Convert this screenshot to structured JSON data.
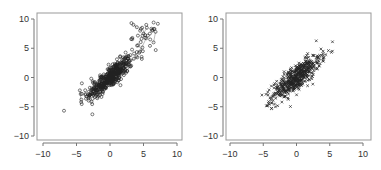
{
  "chart_data": [
    {
      "type": "scatter",
      "title": "",
      "xlabel": "",
      "ylabel": "",
      "xlim": [
        -11,
        11
      ],
      "ylim": [
        -11,
        11
      ],
      "xticks": [
        -10,
        -5,
        0,
        5,
        10
      ],
      "yticks": [
        -10,
        -5,
        0,
        5,
        10
      ],
      "xtick_labels": [
        "−10",
        "−5",
        "0",
        "5",
        "10"
      ],
      "ytick_labels": [
        "10",
        "5",
        "0",
        "−5",
        "−10"
      ],
      "grid": false,
      "marker": "circle",
      "connected_trace": true,
      "series": [
        {
          "name": "main-cloud",
          "center": [
            0,
            0
          ],
          "spread_x": 1.7,
          "corr": 0.85,
          "n": 420,
          "points_sample": [
            [
              -4.3,
              -4.2
            ],
            [
              -4.5,
              -2.2
            ],
            [
              -4.2,
              -1.0
            ],
            [
              -3.0,
              -3.0
            ],
            [
              -2.0,
              -2.5
            ],
            [
              -1.0,
              -1.0
            ],
            [
              0.0,
              0.0
            ],
            [
              1.0,
              1.5
            ],
            [
              2.0,
              2.5
            ],
            [
              2.7,
              3.2
            ],
            [
              -2.8,
              -0.2
            ],
            [
              -1.5,
              -3.0
            ],
            [
              0.5,
              -1.0
            ],
            [
              1.5,
              3.5
            ]
          ]
        },
        {
          "name": "outlier-cluster",
          "center": [
            5.2,
            7.0
          ],
          "n": 40,
          "points_sample": [
            [
              3.2,
              9.3
            ],
            [
              3.5,
              9.0
            ],
            [
              4.0,
              8.6
            ],
            [
              4.5,
              8.0
            ],
            [
              5.0,
              7.5
            ],
            [
              5.5,
              8.5
            ],
            [
              6.0,
              6.5
            ],
            [
              6.5,
              6.0
            ],
            [
              6.8,
              7.8
            ],
            [
              6.3,
              8.0
            ],
            [
              4.2,
              5.5
            ],
            [
              4.9,
              4.5
            ],
            [
              3.6,
              4.1
            ],
            [
              5.4,
              6.7
            ]
          ]
        }
      ]
    },
    {
      "type": "scatter",
      "title": "",
      "xlabel": "",
      "ylabel": "",
      "xlim": [
        -11,
        11
      ],
      "ylim": [
        -11,
        11
      ],
      "xticks": [
        -10,
        -5,
        0,
        5,
        10
      ],
      "yticks": [
        -10,
        -5,
        0,
        5,
        10
      ],
      "xtick_labels": [
        "−10",
        "−5",
        "0",
        "5",
        "10"
      ],
      "ytick_labels": [
        "10",
        "5",
        "0",
        "−5",
        "−10"
      ],
      "grid": false,
      "marker": "x",
      "connected_trace": false,
      "series": [
        {
          "name": "cloud",
          "center": [
            0,
            0
          ],
          "spread_x": 1.8,
          "corr": 0.82,
          "n": 520,
          "points_sample": [
            [
              -5.2,
              -3.0
            ],
            [
              -4.3,
              -4.8
            ],
            [
              -4.0,
              -3.5
            ],
            [
              -3.0,
              -2.0
            ],
            [
              -2.0,
              -1.5
            ],
            [
              -1.0,
              0.5
            ],
            [
              0.0,
              0.0
            ],
            [
              1.0,
              1.0
            ],
            [
              2.0,
              2.0
            ],
            [
              3.0,
              3.0
            ],
            [
              4.0,
              4.5
            ],
            [
              4.8,
              4.6
            ],
            [
              -2.2,
              -4.2
            ],
            [
              2.5,
              0.5
            ]
          ]
        }
      ]
    }
  ],
  "plots": [
    {
      "frame": {
        "x0": 37,
        "y0": 13,
        "x1": 182,
        "y1": 140
      },
      "xmap": {
        "v0": -10,
        "p0": 43,
        "v1": 10,
        "p1": 177
      },
      "ymap": {
        "v0": 10,
        "p0": 19,
        "v1": -10,
        "p1": 136
      }
    },
    {
      "frame": {
        "x0": 226,
        "y0": 13,
        "x1": 371,
        "y1": 140
      },
      "xmap": {
        "v0": -10,
        "p0": 230,
        "v1": 10,
        "p1": 363
      },
      "ymap": {
        "v0": 10,
        "p0": 19,
        "v1": -10,
        "p1": 136
      }
    }
  ],
  "colors": {
    "axis": "#777777",
    "point": "#222222",
    "frame": "#999999",
    "text": "#333333"
  }
}
